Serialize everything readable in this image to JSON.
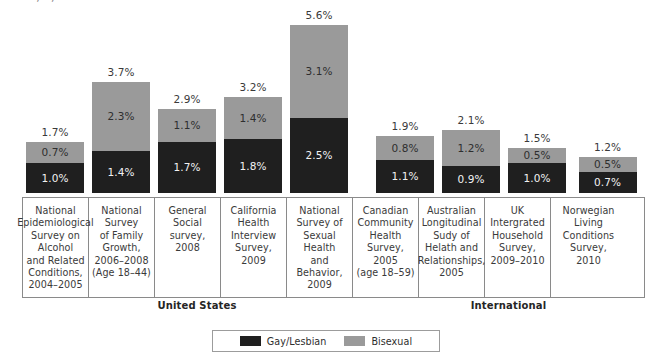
{
  "top_sliver_text": "·   ·        ·                  ,        ·             ,  ·                         ·  ·",
  "colors": {
    "gay_lesbian": "#1f1f1f",
    "bisexual": "#9a9a9a",
    "border": "#8a8a8a",
    "text": "#3a3a3a",
    "background": "#ffffff"
  },
  "legend": {
    "items": [
      {
        "label": "Gay/Lesbian",
        "color": "#1f1f1f",
        "swatch": "swatch-gl"
      },
      {
        "label": "Bisexual",
        "color": "#9a9a9a",
        "swatch": "swatch-bi"
      }
    ]
  },
  "groups": [
    {
      "label": "United States",
      "left": 22,
      "width": 350
    },
    {
      "label": "International",
      "left": 372,
      "width": 273
    }
  ],
  "chart_data": {
    "type": "bar",
    "stacked": true,
    "title": "",
    "xlabel": "",
    "ylabel": "",
    "ylim": [
      0,
      5.6
    ],
    "grid": false,
    "legend_position": "bottom-center",
    "unit": "%",
    "categories": [
      "National Epidemiological Survey on Alcohol and Related Conditions, 2004–2005",
      "National Survey of Family Growth, 2006–2008 (Age 18–44)",
      "General Social survey, 2008",
      "California Health Interview Survey, 2009",
      "National Survey of Sexual Health and Behavior, 2009",
      "Canadian Community Health Survey, 2005 (age 18–59)",
      "Australian Longitudinal Sudy of Helath and Relationships, 2005",
      "UK Intergrated Household Survey, 2009–2010",
      "Norwegian Living Conditions Survey, 2010"
    ],
    "series": [
      {
        "name": "Gay/Lesbian",
        "color": "#1f1f1f",
        "values": [
          1.0,
          1.4,
          1.7,
          1.8,
          2.5,
          1.1,
          0.9,
          1.0,
          0.7
        ]
      },
      {
        "name": "Bisexual",
        "color": "#9a9a9a",
        "values": [
          0.7,
          2.3,
          1.1,
          1.4,
          3.1,
          0.8,
          1.2,
          0.5,
          0.5
        ]
      }
    ],
    "totals": [
      1.7,
      3.7,
      2.9,
      3.2,
      5.6,
      1.9,
      2.1,
      1.5,
      1.2
    ],
    "bars": [
      {
        "name": "National Epidemiological Survey on Alcohol and Related Conditions, 2004–2005",
        "name_lines": "National\nEpidemiological\nSurvey on\nAlcohol\nand Related\nConditions,\n2004–2005",
        "gay_lesbian": "1.0%",
        "bisexual": "0.7%",
        "total": "1.7%",
        "gay_lesbian_value": 1.0,
        "bisexual_value": 0.7,
        "total_value": 1.7,
        "group": "United States",
        "left": 22,
        "width": 66
      },
      {
        "name": "National Survey of Family Growth, 2006–2008 (Age 18–44)",
        "name_lines": "National\nSurvey\nof Family\nGrowth,\n2006–2008\n(Age 18–44)",
        "gay_lesbian": "1.4%",
        "bisexual": "2.3%",
        "total": "3.7%",
        "gay_lesbian_value": 1.4,
        "bisexual_value": 2.3,
        "total_value": 3.7,
        "group": "United States",
        "left": 88,
        "width": 66
      },
      {
        "name": "General Social survey, 2008",
        "name_lines": "General\nSocial\nsurvey,\n2008",
        "gay_lesbian": "1.7%",
        "bisexual": "1.1%",
        "total": "2.9%",
        "gay_lesbian_value": 1.7,
        "bisexual_value": 1.1,
        "total_value": 2.9,
        "group": "United States",
        "left": 154,
        "width": 66
      },
      {
        "name": "California Health Interview Survey, 2009",
        "name_lines": "California\nHealth\nInterview\nSurvey,\n2009",
        "gay_lesbian": "1.8%",
        "bisexual": "1.4%",
        "total": "3.2%",
        "gay_lesbian_value": 1.8,
        "bisexual_value": 1.4,
        "total_value": 3.2,
        "group": "United States",
        "left": 220,
        "width": 66
      },
      {
        "name": "National Survey of Sexual Health and Behavior, 2009",
        "name_lines": "National\nSurvey of\nSexual\nHealth\nand\nBehavior,\n2009",
        "gay_lesbian": "2.5%",
        "bisexual": "3.1%",
        "total": "5.6%",
        "gay_lesbian_value": 2.5,
        "bisexual_value": 3.1,
        "total_value": 5.6,
        "group": "United States",
        "left": 286,
        "width": 66
      },
      {
        "name": "Canadian Community Health Survey, 2005 (age 18–59)",
        "name_lines": "Canadian\nCommunity\nHealth\nSurvey,\n2005\n(age 18–59)",
        "gay_lesbian": "1.1%",
        "bisexual": "0.8%",
        "total": "1.9%",
        "gay_lesbian_value": 1.1,
        "bisexual_value": 0.8,
        "total_value": 1.9,
        "group": "International",
        "left": 372,
        "width": 66
      },
      {
        "name": "Australian Longitudinal Sudy of Helath and Relationships, 2005",
        "name_lines": "Australian\nLongitudinal\nSudy of\nHelath and\nRelationships,\n2005",
        "gay_lesbian": "0.9%",
        "bisexual": "1.2%",
        "total": "2.1%",
        "gay_lesbian_value": 0.9,
        "bisexual_value": 1.2,
        "total_value": 2.1,
        "group": "International",
        "left": 438,
        "width": 66
      },
      {
        "name": "UK Intergrated Household Survey, 2009–2010",
        "name_lines": "UK Intergrated\nHousehold\nSurvey,\n2009–2010",
        "gay_lesbian": "1.0%",
        "bisexual": "0.5%",
        "total": "1.5%",
        "gay_lesbian_value": 1.0,
        "bisexual_value": 0.5,
        "total_value": 1.5,
        "group": "International",
        "left": 504,
        "width": 66
      },
      {
        "name": "Norwegian Living Conditions Survey, 2010",
        "name_lines": "Norwegian\nLiving\nConditions\nSurvey,\n2010",
        "gay_lesbian": "0.7%",
        "bisexual": "0.5%",
        "total": "1.2%",
        "gay_lesbian_value": 0.7,
        "bisexual_value": 0.5,
        "total_value": 1.2,
        "group": "International",
        "left": 570,
        "width": 75
      }
    ]
  }
}
